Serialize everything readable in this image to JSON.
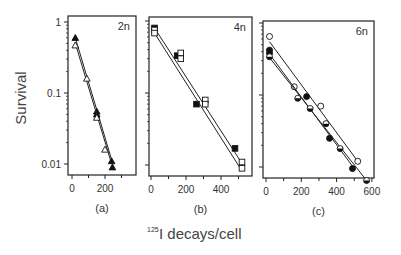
{
  "figure": {
    "ylabel": "Survival",
    "xlabel_sup": "125",
    "xlabel": "I decays/cell"
  },
  "chart_data": [
    {
      "type": "scatter",
      "panel": "(a)",
      "tag": "2n",
      "xlabel": "125I decays/cell",
      "ylabel": "Survival",
      "yscale": "log",
      "ylim": [
        0.007,
        1.2
      ],
      "xlim": [
        -30,
        380
      ],
      "xticks": [
        0,
        200
      ],
      "yticks": [
        1,
        0.1,
        0.01
      ],
      "ytick_labels": [
        "1",
        "0.1",
        "0.01"
      ],
      "grid": false,
      "series": [
        {
          "name": "filled triangles",
          "marker": "triangle-filled",
          "x": [
            20,
            150,
            150,
            240,
            245
          ],
          "y": [
            0.6,
            0.055,
            0.05,
            0.011,
            0.009
          ],
          "fit": [
            [
              20,
              0.6
            ],
            [
              245,
              0.0105
            ]
          ]
        },
        {
          "name": "open triangles",
          "marker": "triangle-open",
          "x": [
            20,
            90,
            150,
            200
          ],
          "y": [
            0.47,
            0.16,
            0.045,
            0.016
          ],
          "fit": [
            [
              20,
              0.5
            ],
            [
              235,
              0.011
            ]
          ]
        }
      ]
    },
    {
      "type": "scatter",
      "panel": "(b)",
      "tag": "4n",
      "xlabel": "125I decays/cell",
      "ylabel": "Survival",
      "yscale": "log",
      "ylim": [
        0.007,
        1.2
      ],
      "xlim": [
        -20,
        560
      ],
      "xticks": [
        0,
        200,
        400
      ],
      "yticks": [
        1,
        0.1,
        0.01
      ],
      "grid": false,
      "series": [
        {
          "name": "filled squares",
          "marker": "square-filled",
          "x": [
            20,
            150,
            260,
            480
          ],
          "y": [
            0.8,
            0.33,
            0.07,
            0.017
          ],
          "fit": [
            [
              20,
              0.8
            ],
            [
              520,
              0.0105
            ]
          ]
        },
        {
          "name": "open squares",
          "marker": "square-open",
          "x": [
            20,
            20,
            170,
            170,
            310,
            310,
            520,
            520
          ],
          "y": [
            0.75,
            0.68,
            0.36,
            0.3,
            0.08,
            0.07,
            0.011,
            0.009
          ],
          "fit": [
            [
              20,
              0.68
            ],
            [
              510,
              0.009
            ]
          ]
        }
      ]
    },
    {
      "type": "scatter",
      "panel": "(c)",
      "tag": "6n",
      "xlabel": "125I decays/cell",
      "ylabel": "Survival",
      "yscale": "log",
      "ylim": [
        0.006,
        1.1
      ],
      "xlim": [
        -20,
        610
      ],
      "xticks": [
        0,
        200,
        400,
        600
      ],
      "yticks": [
        1,
        0.1,
        0.01
      ],
      "grid": false,
      "series": [
        {
          "name": "open circles",
          "marker": "circle-open",
          "x": [
            20,
            160,
            310,
            520
          ],
          "y": [
            0.65,
            0.13,
            0.07,
            0.012
          ],
          "fit": [
            [
              20,
              0.55
            ],
            [
              520,
              0.012
            ]
          ]
        },
        {
          "name": "filled circles",
          "marker": "circle-filled",
          "x": [
            20,
            20,
            230,
            360,
            490
          ],
          "y": [
            0.42,
            0.38,
            0.095,
            0.025,
            0.0095
          ],
          "fit": [
            [
              20,
              0.37
            ],
            [
              500,
              0.0095
            ]
          ]
        },
        {
          "name": "half-filled circles",
          "marker": "circle-half",
          "x": [
            20,
            180,
            250,
            340,
            420,
            570
          ],
          "y": [
            0.34,
            0.09,
            0.065,
            0.04,
            0.018,
            0.0065
          ],
          "fit": [
            [
              20,
              0.33
            ],
            [
              570,
              0.0065
            ]
          ]
        }
      ]
    }
  ]
}
